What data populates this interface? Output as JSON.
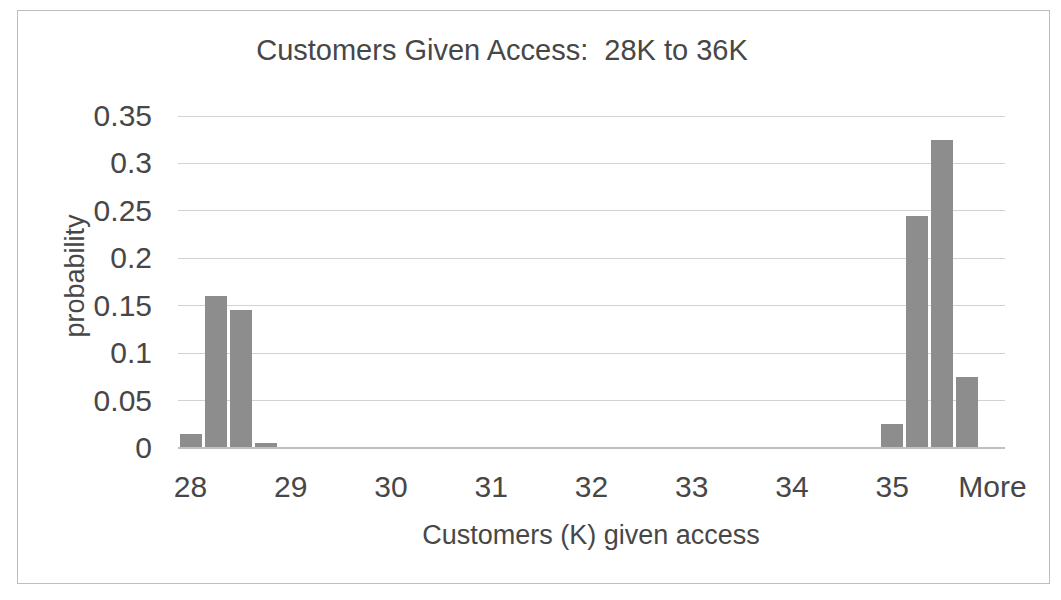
{
  "chart_data": {
    "type": "bar",
    "title": "Customers Given Access:  28K to 36K",
    "xlabel": "Customers (K) given access",
    "ylabel": "probability",
    "categories": [
      "28",
      "28.25",
      "28.5",
      "28.75",
      "29",
      "29.25",
      "29.5",
      "29.75",
      "30",
      "30.25",
      "30.5",
      "30.75",
      "31",
      "31.25",
      "31.5",
      "31.75",
      "32",
      "32.25",
      "32.5",
      "32.75",
      "33",
      "33.25",
      "33.5",
      "33.75",
      "34",
      "34.25",
      "34.5",
      "34.75",
      "35",
      "35.25",
      "35.5",
      "35.75",
      "More"
    ],
    "values": [
      0.015,
      0.16,
      0.145,
      0.005,
      0,
      0,
      0,
      0,
      0,
      0,
      0,
      0,
      0,
      0,
      0,
      0,
      0,
      0,
      0,
      0,
      0,
      0,
      0,
      0,
      0,
      0,
      0,
      0,
      0.025,
      0.245,
      0.325,
      0.075,
      0
    ],
    "x_ticks": [
      {
        "index": 0,
        "label": "28"
      },
      {
        "index": 4,
        "label": "29"
      },
      {
        "index": 8,
        "label": "30"
      },
      {
        "index": 12,
        "label": "31"
      },
      {
        "index": 16,
        "label": "32"
      },
      {
        "index": 20,
        "label": "33"
      },
      {
        "index": 24,
        "label": "34"
      },
      {
        "index": 28,
        "label": "35"
      },
      {
        "index": 32,
        "label": "More"
      }
    ],
    "ytick_values": [
      0,
      0.05,
      0.1,
      0.15,
      0.2,
      0.25,
      0.3,
      0.35
    ],
    "ytick_labels": [
      "0",
      "0.05",
      "0.1",
      "0.15",
      "0.2",
      "0.25",
      "0.3",
      "0.35"
    ],
    "ylim": [
      0,
      0.35
    ],
    "grid": true,
    "legend": "none",
    "bar_color": "#8d8d8d",
    "gridline_color": "#d2d2d2",
    "axis_line_color": "#c0c0c0",
    "frame_color": "#bdbdbd",
    "text_color": "#474747"
  }
}
